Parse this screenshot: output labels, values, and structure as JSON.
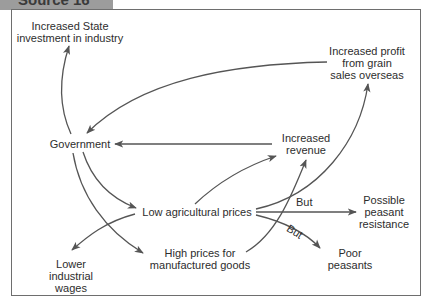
{
  "source_tab": {
    "label": "Source 16"
  },
  "nodes": {
    "state_investment": [
      "Increased State",
      "investment in industry"
    ],
    "grain_profit": [
      "Increased profit",
      "from grain",
      "sales overseas"
    ],
    "government": [
      "Government"
    ],
    "increased_revenue": [
      "Increased",
      "revenue"
    ],
    "low_agri_prices": [
      "Low agricultural prices"
    ],
    "peasant_resistance": [
      "Possible",
      "peasant",
      "resistance"
    ],
    "high_manuf_prices": [
      "High prices for",
      "manufactured goods"
    ],
    "lower_wages": [
      "Lower",
      "industrial",
      "wages"
    ],
    "poor_peasants": [
      "Poor",
      "peasants"
    ]
  },
  "edge_labels": {
    "but_resistance": "But",
    "but_poor": "But"
  },
  "edges": [
    {
      "from": "Government",
      "to": "Increased State investment in industry"
    },
    {
      "from": "Increased profit from grain sales overseas",
      "to": "Government"
    },
    {
      "from": "Increased revenue",
      "to": "Government"
    },
    {
      "from": "Government",
      "to": "Low agricultural prices"
    },
    {
      "from": "Government",
      "to": "High prices for manufactured goods"
    },
    {
      "from": "Low agricultural prices",
      "to": "Increased revenue"
    },
    {
      "from": "Low agricultural prices",
      "to": "Increased profit from grain sales overseas"
    },
    {
      "from": "Low agricultural prices",
      "to": "Possible peasant resistance",
      "label": "But"
    },
    {
      "from": "Low agricultural prices",
      "to": "Poor peasants",
      "label": "But"
    },
    {
      "from": "Low agricultural prices",
      "to": "Lower industrial wages"
    },
    {
      "from": "High prices for manufactured goods",
      "to": "Increased revenue"
    }
  ],
  "colors": {
    "line": "#555555",
    "tab": "#9c9c9c",
    "frame": "#6e6e6e",
    "text": "#2d2d2d"
  }
}
